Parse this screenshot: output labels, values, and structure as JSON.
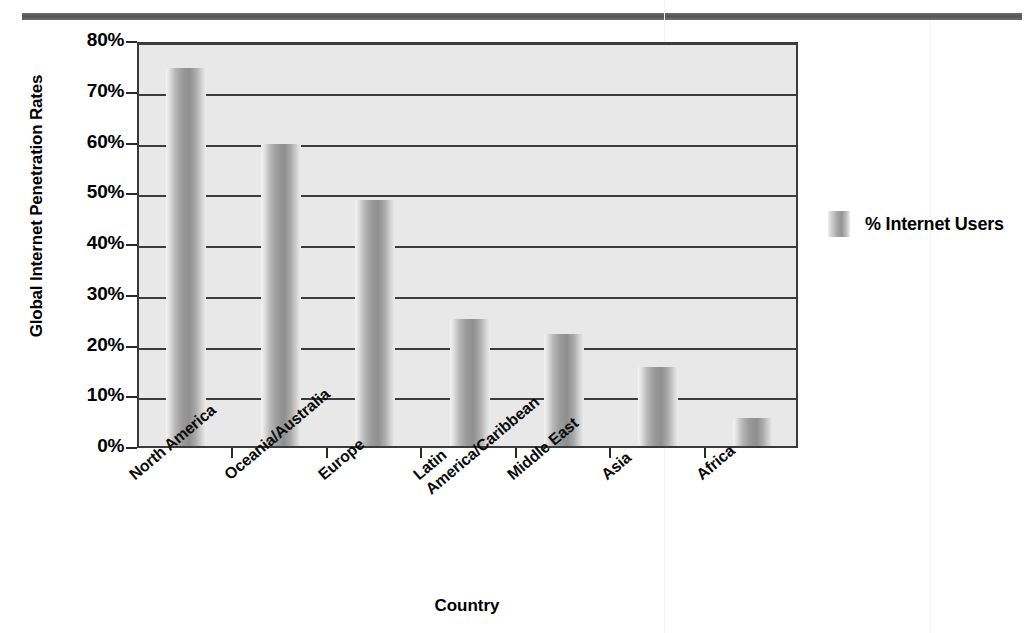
{
  "decor": {
    "top_rule_color": "#545454"
  },
  "chart_data": {
    "type": "bar",
    "title": "",
    "xlabel": "Country",
    "ylabel": "Global Internet Penetration Rates",
    "categories": [
      "North America",
      "Oceania/Australia",
      "Europe",
      "Latin America/Caribbean",
      "Middle East",
      "Asia",
      "Africa"
    ],
    "category_lines": [
      [
        "North America"
      ],
      [
        "Oceania/Australia"
      ],
      [
        "Europe"
      ],
      [
        "Latin",
        "America/Caribbean"
      ],
      [
        "Middle East"
      ],
      [
        "Asia"
      ],
      [
        "Africa"
      ]
    ],
    "values": [
      74.5,
      59.5,
      48.5,
      25.0,
      22.0,
      15.5,
      5.5
    ],
    "series": [
      {
        "name": "% Internet Users",
        "values": [
          74.5,
          59.5,
          48.5,
          25.0,
          22.0,
          15.5,
          5.5
        ]
      }
    ],
    "ylim": [
      0,
      80
    ],
    "ytick_values": [
      0,
      10,
      20,
      30,
      40,
      50,
      60,
      70,
      80
    ],
    "ytick_labels": [
      "0%",
      "10%",
      "20%",
      "30%",
      "40%",
      "50%",
      "60%",
      "70%",
      "80%"
    ],
    "grid": true,
    "legend": {
      "position": "right",
      "entries": [
        "% Internet Users"
      ]
    },
    "bar_color": "#9b9b9b",
    "plot_background": "#e8e8e8",
    "axis_color": "#3a3a3a"
  }
}
